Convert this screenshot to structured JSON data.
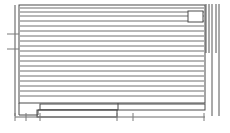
{
  "drawing": {
    "type": "architectural-elevation",
    "title": "Wall Elevation",
    "stroke_color": "#5a5a5a",
    "background_color": "#ffffff",
    "canvas": {
      "width": 230,
      "height": 133
    },
    "main_wall": {
      "name": "wall-elevation-panel",
      "x": 19,
      "y": 5,
      "width": 186,
      "height": 98
    },
    "siding_lines": {
      "name": "horizontal-siding-courses",
      "count": 19,
      "x_start": 20,
      "x_end": 204,
      "y_values": [
        8,
        12,
        16,
        21,
        26,
        31,
        36,
        41,
        46,
        51,
        56,
        61,
        66,
        71,
        76,
        81,
        86,
        91,
        96
      ]
    },
    "left_edge_post": {
      "name": "left-vertical-edge",
      "x": 15,
      "y_top": 5,
      "y_bottom": 116
    },
    "left_ticks": {
      "name": "left-elevation-markers",
      "x_start": 7,
      "x_end": 19,
      "y_values": [
        34,
        49
      ]
    },
    "window": {
      "name": "window-opening",
      "x": 188,
      "y": 11,
      "width": 15,
      "height": 11
    },
    "right_posts": {
      "name": "right-vertical-framing",
      "x_values": [
        206,
        209,
        212,
        216
      ],
      "y_top": 4,
      "y_bottom": 53
    },
    "right_outer_post": {
      "name": "right-outer-edge",
      "x": 219,
      "y_top": 4,
      "y_bottom": 116
    },
    "right_tail_post": {
      "name": "right-inner-tail",
      "x": 212,
      "y_top": 53,
      "y_bottom": 116
    },
    "footing_step": {
      "name": "foundation-step",
      "points": "19,103 19,115 38,115 38,110 118,110 118,103"
    },
    "slab": {
      "name": "floor-slab-outline",
      "x": 40,
      "y": 104,
      "width": 165,
      "height": 6
    },
    "lower_slab": {
      "name": "lower-slab-outline",
      "x": 37,
      "y": 110,
      "width": 80,
      "height": 7
    },
    "ground_line": {
      "name": "grade-line",
      "x_start": 15,
      "x_end": 205,
      "y": 117
    },
    "ground_ticks": {
      "name": "grade-dimension-ticks",
      "y_top": 113,
      "y_bottom": 121,
      "x_values": [
        15,
        26,
        40,
        117,
        133,
        204
      ]
    }
  }
}
